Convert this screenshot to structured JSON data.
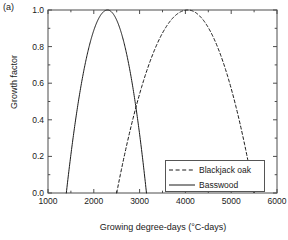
{
  "panel": {
    "label": "(a)"
  },
  "axes": {
    "xlabel": "Growing degree-days (°C-days)",
    "ylabel": "Growth factor",
    "xticks": [
      "1000",
      "2000",
      "3000",
      "4000",
      "5000",
      "6000"
    ],
    "yticks": [
      "0.0",
      "0.2",
      "0.4",
      "0.6",
      "0.8",
      "1.0"
    ]
  },
  "legend": {
    "items": [
      {
        "label": "Blackjack oak",
        "style": "dashed"
      },
      {
        "label": "Basswood",
        "style": "solid"
      }
    ]
  },
  "colors": {
    "line": "#1a1a1a",
    "axis": "#4d4d4d",
    "background": "#ffffff"
  },
  "chart_data": {
    "type": "line",
    "title": "",
    "xlabel": "Growing degree-days (°C-days)",
    "ylabel": "Growth factor",
    "xlim": [
      1000,
      6000
    ],
    "ylim": [
      0.0,
      1.0
    ],
    "xticks": [
      1000,
      2000,
      3000,
      4000,
      5000,
      6000
    ],
    "yticks": [
      0.0,
      0.2,
      0.4,
      0.6,
      0.8,
      1.0
    ],
    "grid": false,
    "legend_position": "lower right",
    "series": [
      {
        "name": "Basswood",
        "style": "solid",
        "gdd_min": 1400,
        "gdd_opt": 2300,
        "gdd_max": 3150,
        "x": [
          1400,
          1500,
          1600,
          1700,
          1800,
          1900,
          2000,
          2100,
          2200,
          2300,
          2400,
          2500,
          2600,
          2700,
          2800,
          2900,
          3000,
          3100,
          3150
        ],
        "values": [
          0.0,
          0.19,
          0.36,
          0.51,
          0.65,
          0.76,
          0.86,
          0.93,
          0.98,
          1.0,
          0.99,
          0.96,
          0.9,
          0.81,
          0.7,
          0.56,
          0.4,
          0.21,
          0.0
        ]
      },
      {
        "name": "Blackjack oak",
        "style": "dashed",
        "gdd_min": 2500,
        "gdd_opt": 4050,
        "gdd_max": 5500,
        "x": [
          2500,
          2700,
          2900,
          3100,
          3300,
          3500,
          3700,
          3900,
          4050,
          4200,
          4400,
          4600,
          4800,
          5000,
          5200,
          5400,
          5500
        ],
        "values": [
          0.0,
          0.15,
          0.29,
          0.43,
          0.56,
          0.68,
          0.79,
          0.89,
          1.0,
          0.97,
          0.91,
          0.82,
          0.7,
          0.56,
          0.39,
          0.18,
          0.0
        ]
      }
    ]
  }
}
